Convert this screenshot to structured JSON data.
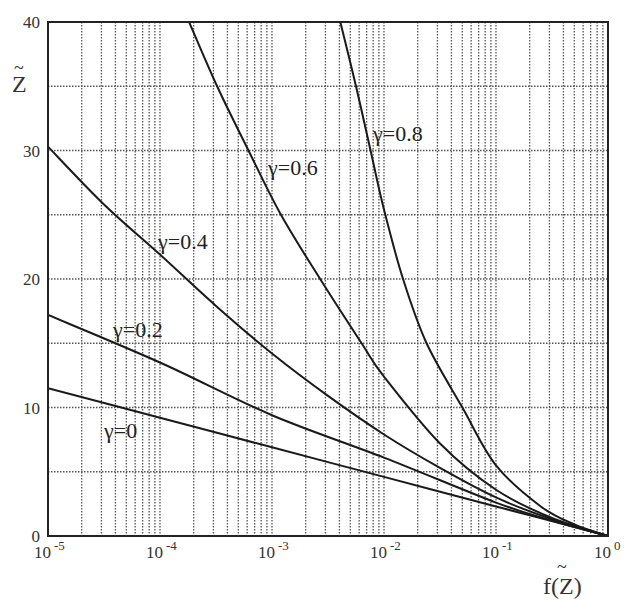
{
  "chart_data": {
    "type": "line",
    "title": "",
    "xlabel": "f(Z~)",
    "ylabel": "Z~",
    "xscale": "log",
    "xlim": [
      1e-05,
      1
    ],
    "ylim": [
      0,
      40
    ],
    "grid": true,
    "grid_style": "dotted",
    "legend": "inline labels on curves",
    "x_tick_labels": [
      {
        "base": "10",
        "exp": "-5",
        "value": 1e-05
      },
      {
        "base": "10",
        "exp": "-4",
        "value": 0.0001
      },
      {
        "base": "10",
        "exp": "-3",
        "value": 0.001
      },
      {
        "base": "10",
        "exp": "-2",
        "value": 0.01
      },
      {
        "base": "10",
        "exp": "-1",
        "value": 0.1
      },
      {
        "base": "10",
        "exp": "0",
        "value": 1
      }
    ],
    "y_tick_labels": [
      "0",
      "10",
      "20",
      "30",
      "40"
    ],
    "y_gridlines": [
      5,
      10,
      15,
      20,
      25,
      30,
      35
    ],
    "series": [
      {
        "name": "γ=0",
        "label": "γ=0",
        "label_pos": [
          104,
          438
        ],
        "points_log10x_y": [
          [
            -5,
            11.5
          ],
          [
            -4,
            9.2
          ],
          [
            -3,
            6.9
          ],
          [
            -2,
            4.6
          ],
          [
            -1,
            2.3
          ],
          [
            0,
            0
          ]
        ]
      },
      {
        "name": "γ=0.2",
        "label": "γ=0.2",
        "label_pos": [
          113,
          337
        ],
        "points_log10x_y": [
          [
            -5,
            17.2
          ],
          [
            -4,
            13.5
          ],
          [
            -3,
            9.4
          ],
          [
            -2,
            6.1
          ],
          [
            -1,
            2.6
          ],
          [
            -0.5,
            1.2
          ],
          [
            0,
            0
          ]
        ]
      },
      {
        "name": "γ=0.4",
        "label": "γ=0.4",
        "label_pos": [
          158,
          249
        ],
        "points_log10x_y": [
          [
            -5,
            30.3
          ],
          [
            -4.5,
            25.8
          ],
          [
            -4,
            21.9
          ],
          [
            -3.5,
            17.9
          ],
          [
            -3,
            14.2
          ],
          [
            -2.5,
            10.9
          ],
          [
            -2,
            7.9
          ],
          [
            -1.5,
            5.3
          ],
          [
            -1,
            3.0
          ],
          [
            -0.5,
            1.3
          ],
          [
            0,
            0
          ]
        ]
      },
      {
        "name": "γ=0.6",
        "label": "γ=0.6",
        "label_pos": [
          268,
          175
        ],
        "points_log10x_y": [
          [
            -3.74,
            40
          ],
          [
            -3.49,
            35
          ],
          [
            -3.21,
            30
          ],
          [
            -2.92,
            25
          ],
          [
            -2.57,
            20
          ],
          [
            -2.2,
            15
          ],
          [
            -2.0,
            12.4
          ],
          [
            -1.5,
            7.2
          ],
          [
            -1,
            3.6
          ],
          [
            -0.5,
            1.4
          ],
          [
            0,
            0
          ]
        ]
      },
      {
        "name": "γ=0.8",
        "label": "γ=0.8",
        "label_pos": [
          373,
          141
        ],
        "points_log10x_y": [
          [
            -2.39,
            40
          ],
          [
            -2.25,
            35
          ],
          [
            -2.12,
            30
          ],
          [
            -2.0,
            25.4
          ],
          [
            -1.83,
            20
          ],
          [
            -1.62,
            15
          ],
          [
            -1.3,
            10
          ],
          [
            -1.0,
            5.5
          ],
          [
            -0.6,
            2.3
          ],
          [
            -0.3,
            0.9
          ],
          [
            0,
            0
          ]
        ]
      }
    ]
  }
}
